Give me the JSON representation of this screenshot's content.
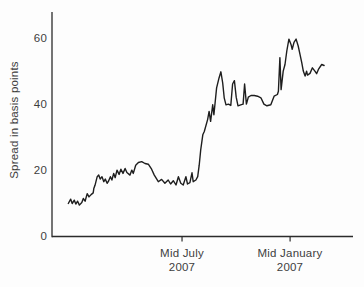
{
  "figure": {
    "background": "#fdfdfd",
    "line_color": "#1e1e1e",
    "axis_color": "#2b2b2b",
    "text_color": "#3d3d3d"
  },
  "chart_data": {
    "type": "line",
    "title": "",
    "xlabel": "",
    "ylabel": "Spread in basis points",
    "ylim": [
      0,
      68
    ],
    "xlim": [
      0,
      100
    ],
    "yticks": [
      0,
      20,
      40,
      60
    ],
    "xticks": [
      {
        "x": 43.2,
        "line1": "Mid July",
        "line2": "2007"
      },
      {
        "x": 79.1,
        "line1": "Mid January",
        "line2": "2007"
      }
    ],
    "grid": false,
    "legend": "none",
    "series": [
      {
        "name": "spread",
        "points": [
          [
            5.4,
            10.0
          ],
          [
            6.2,
            11.3
          ],
          [
            6.7,
            10.0
          ],
          [
            7.4,
            11.0
          ],
          [
            7.9,
            9.8
          ],
          [
            8.5,
            10.7
          ],
          [
            9.1,
            9.5
          ],
          [
            9.9,
            10.3
          ],
          [
            10.4,
            11.5
          ],
          [
            11.0,
            10.7
          ],
          [
            11.7,
            13.0
          ],
          [
            12.3,
            12.0
          ],
          [
            13.0,
            12.7
          ],
          [
            13.7,
            13.2
          ],
          [
            13.9,
            14.5
          ],
          [
            14.3,
            15.5
          ],
          [
            15.0,
            18.1
          ],
          [
            15.5,
            18.6
          ],
          [
            16.0,
            17.4
          ],
          [
            16.6,
            18.1
          ],
          [
            17.2,
            16.6
          ],
          [
            17.7,
            17.4
          ],
          [
            18.3,
            16.1
          ],
          [
            18.8,
            16.8
          ],
          [
            19.4,
            18.1
          ],
          [
            19.9,
            17.1
          ],
          [
            20.5,
            19.1
          ],
          [
            21.0,
            17.8
          ],
          [
            21.6,
            20.1
          ],
          [
            22.3,
            18.8
          ],
          [
            22.9,
            20.4
          ],
          [
            23.6,
            19.1
          ],
          [
            24.3,
            20.6
          ],
          [
            24.9,
            19.4
          ],
          [
            25.9,
            18.6
          ],
          [
            26.5,
            20.1
          ],
          [
            27.0,
            19.1
          ],
          [
            27.8,
            21.6
          ],
          [
            28.7,
            22.4
          ],
          [
            29.8,
            22.7
          ],
          [
            30.9,
            22.1
          ],
          [
            32.0,
            21.9
          ],
          [
            33.1,
            20.4
          ],
          [
            34.0,
            18.6
          ],
          [
            35.3,
            16.6
          ],
          [
            36.4,
            17.3
          ],
          [
            37.5,
            16.1
          ],
          [
            38.6,
            17.1
          ],
          [
            39.4,
            15.9
          ],
          [
            40.3,
            16.9
          ],
          [
            41.2,
            15.6
          ],
          [
            42.0,
            18.1
          ],
          [
            42.8,
            16.1
          ],
          [
            43.6,
            15.6
          ],
          [
            44.5,
            18.1
          ],
          [
            45.0,
            15.9
          ],
          [
            45.8,
            16.3
          ],
          [
            46.5,
            19.3
          ],
          [
            46.9,
            16.6
          ],
          [
            47.8,
            17.1
          ],
          [
            48.4,
            18.1
          ],
          [
            48.9,
            21.6
          ],
          [
            49.4,
            26.2
          ],
          [
            50.1,
            30.8
          ],
          [
            50.6,
            31.8
          ],
          [
            51.7,
            35.4
          ],
          [
            52.2,
            37.9
          ],
          [
            52.7,
            34.9
          ],
          [
            53.4,
            39.9
          ],
          [
            53.8,
            36.9
          ],
          [
            54.7,
            45.0
          ],
          [
            55.5,
            48.1
          ],
          [
            56.1,
            49.9
          ],
          [
            56.7,
            46.5
          ],
          [
            57.2,
            42.0
          ],
          [
            57.8,
            39.9
          ],
          [
            58.6,
            40.1
          ],
          [
            59.4,
            39.7
          ],
          [
            60.0,
            46.2
          ],
          [
            60.6,
            47.2
          ],
          [
            61.2,
            42.2
          ],
          [
            61.8,
            39.6
          ],
          [
            62.7,
            39.9
          ],
          [
            63.5,
            40.1
          ],
          [
            64.0,
            46.2
          ],
          [
            64.6,
            40.1
          ],
          [
            65.2,
            42.2
          ],
          [
            66.1,
            42.7
          ],
          [
            67.2,
            42.7
          ],
          [
            68.3,
            42.5
          ],
          [
            69.4,
            42.0
          ],
          [
            70.4,
            40.1
          ],
          [
            71.4,
            39.6
          ],
          [
            72.7,
            39.9
          ],
          [
            73.8,
            42.5
          ],
          [
            74.9,
            43.0
          ],
          [
            75.2,
            44.0
          ],
          [
            75.7,
            54.2
          ],
          [
            76.1,
            44.5
          ],
          [
            76.8,
            50.1
          ],
          [
            77.4,
            52.1
          ],
          [
            78.0,
            56.2
          ],
          [
            78.7,
            59.8
          ],
          [
            79.4,
            58.2
          ],
          [
            79.8,
            56.7
          ],
          [
            80.4,
            58.8
          ],
          [
            81.1,
            59.8
          ],
          [
            81.8,
            57.7
          ],
          [
            82.4,
            55.2
          ],
          [
            83.0,
            52.6
          ],
          [
            83.5,
            50.1
          ],
          [
            84.1,
            48.6
          ],
          [
            84.6,
            50.1
          ],
          [
            84.9,
            48.9
          ],
          [
            85.7,
            49.4
          ],
          [
            86.5,
            51.1
          ],
          [
            87.4,
            50.0
          ],
          [
            87.9,
            49.3
          ],
          [
            88.5,
            50.6
          ],
          [
            89.6,
            52.1
          ],
          [
            90.4,
            51.8
          ]
        ]
      }
    ]
  }
}
